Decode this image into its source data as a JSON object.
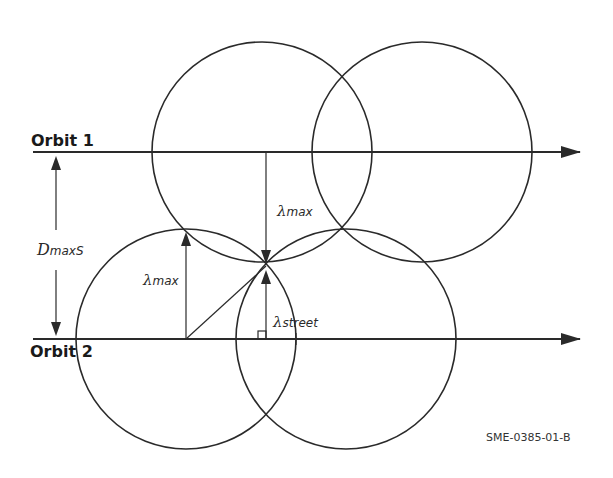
{
  "labels": {
    "orbit1": "Orbit 1",
    "orbit2": "Orbit 2",
    "dmax_main": "D",
    "dmax_sub": "maxS",
    "lambda_symbol": "λ",
    "lambda_max_sub": "max",
    "lambda_street_sub": "street",
    "figure_id": "SME-0385-01-B"
  },
  "colors": {
    "stroke": "#2a2a2a",
    "background": "#ffffff"
  }
}
